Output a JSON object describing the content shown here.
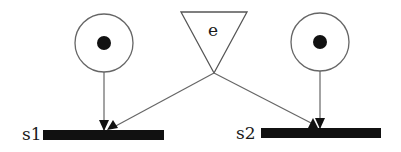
{
  "diagram": {
    "type": "petri-net",
    "colors": {
      "stroke": "#555555",
      "fill": "#111111",
      "background": "#ffffff"
    },
    "places": [
      {
        "id": "p1",
        "cx": 104,
        "cy": 43,
        "r": 29,
        "tokens": 1
      },
      {
        "id": "p2",
        "cx": 320,
        "cy": 42,
        "r": 29,
        "tokens": 1
      }
    ],
    "event": {
      "label": "e",
      "shape": "inverted-triangle"
    },
    "transitions": [
      {
        "id": "s1",
        "label": "s1"
      },
      {
        "id": "s2",
        "label": "s2"
      }
    ],
    "arcs": [
      {
        "from": "p1",
        "to": "s1"
      },
      {
        "from": "e",
        "to": "s1"
      },
      {
        "from": "p2",
        "to": "s2"
      },
      {
        "from": "e",
        "to": "s2"
      }
    ]
  }
}
